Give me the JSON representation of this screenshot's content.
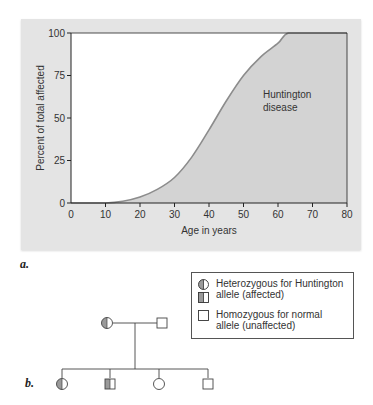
{
  "figure_a": {
    "label": "a.",
    "chart_data": {
      "type": "area",
      "title": "",
      "xlabel": "Age in years",
      "ylabel": "Percent of total affected",
      "xlim": [
        0,
        80
      ],
      "ylim": [
        0,
        100
      ],
      "x_ticks": [
        0,
        10,
        20,
        30,
        40,
        50,
        60,
        70,
        80
      ],
      "y_ticks": [
        0,
        25,
        50,
        75,
        100
      ],
      "x_tick_labels": [
        "0",
        "10",
        "20",
        "30",
        "40",
        "50",
        "60",
        "70",
        "80"
      ],
      "y_tick_labels": [
        "0",
        "25",
        "50",
        "75",
        "100"
      ],
      "grid": false,
      "legend": null,
      "series": [
        {
          "name": "Huntington disease",
          "x": [
            0,
            10,
            15,
            20,
            25,
            30,
            35,
            40,
            45,
            50,
            55,
            60,
            63,
            70,
            80
          ],
          "values": [
            0,
            0,
            1,
            3.5,
            8,
            15,
            27,
            43,
            60,
            75,
            86,
            94,
            100,
            100,
            100
          ]
        }
      ],
      "annotations": [
        {
          "text": "Huntington disease",
          "x": 56,
          "y": 63
        }
      ]
    },
    "annotation_line1": "Huntington",
    "annotation_line2": "disease",
    "colors": {
      "panel_bg": "#e4e4e4",
      "plot_bg": "#ffffff",
      "area_fill": "#d3d3d3",
      "curve": "#8c8c8c",
      "axis": "#222222"
    }
  },
  "figure_b": {
    "label": "b.",
    "legend": {
      "items": [
        {
          "symbols": [
            "half-filled-circle",
            "half-filled-square"
          ],
          "line1": "Heterozygous for Huntington",
          "line2": "allele (affected)"
        },
        {
          "symbols": [
            "empty-square"
          ],
          "line1": "Homozygous for normal",
          "line2": "allele (unaffected)"
        }
      ]
    },
    "pedigree": {
      "parents": [
        {
          "sex": "female",
          "status": "heterozygous-affected"
        },
        {
          "sex": "male",
          "status": "homozygous-normal"
        }
      ],
      "children": [
        {
          "sex": "female",
          "status": "heterozygous-affected"
        },
        {
          "sex": "male",
          "status": "heterozygous-affected"
        },
        {
          "sex": "female",
          "status": "homozygous-normal"
        },
        {
          "sex": "male",
          "status": "homozygous-normal"
        }
      ]
    }
  }
}
